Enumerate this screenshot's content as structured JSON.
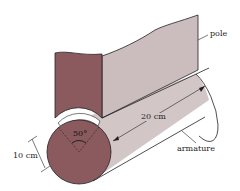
{
  "figure": {
    "labels": {
      "pole": "pole",
      "armature": "armature",
      "length": "20 cm",
      "diameter": "10 cm",
      "angle": "50°"
    },
    "colors": {
      "end_face": "#8a5a5e",
      "pole_side": "#cbbcbe",
      "armature_side": "#d3c6c7",
      "outline": "#222222",
      "background": "#ffffff"
    }
  }
}
